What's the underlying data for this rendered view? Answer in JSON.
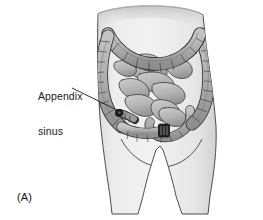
{
  "figure": {
    "panel_caption": "(A)",
    "annotation": {
      "line1": "Appendix",
      "line2": "sinus"
    },
    "alt_description": "Line drawing of a human lower torso showing the large intestine and small bowel, with an appendix sinus stoma on the lower left abdomen",
    "colors": {
      "background": "#ffffff",
      "body_fill": "#e8e8e8",
      "body_outline": "#3a3a3a",
      "bowel_fill": "#b4b4b4",
      "bowel_shadow": "#8e8e8e",
      "bowel_outline": "#2e2e2e",
      "stoma_dark": "#2a2a2a",
      "leader_line": "#1a1a1a",
      "text": "#1a1a1a"
    },
    "parts": [
      "torso",
      "transverse-colon",
      "ascending-colon",
      "descending-colon",
      "sigmoid-colon",
      "small-intestine",
      "appendix-sinus-stoma",
      "colostomy-stoma"
    ]
  }
}
